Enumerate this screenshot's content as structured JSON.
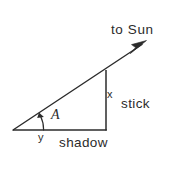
{
  "figure": {
    "kind": "geometry-diagram",
    "topic": "stick-shadow-sun-angle right triangle",
    "background_color": "#ffffff",
    "stroke_color": "#2b2b2b",
    "text_color": "#2b2b2b",
    "labels": {
      "sun_ray": "to Sun",
      "vertical_leg_symbol": "x",
      "vertical_leg_name": "stick",
      "horizontal_leg_symbol": "y",
      "horizontal_leg_name": "shadow",
      "angle_symbol": "A"
    },
    "icons": {
      "sun_ray_arrow": "arrow-up-right-icon",
      "angle_arc_arrow": "angle-arc-arrow-icon"
    },
    "geometry": {
      "vertex_angle": [
        13,
        130
      ],
      "vertex_right_angle": [
        106,
        130
      ],
      "vertex_stick_top": [
        106,
        70
      ],
      "arrow_tip": [
        145,
        42
      ],
      "horizontal_baseline_y": 130,
      "vertical_leg_x": 106,
      "angle_arc_radius": 30
    }
  }
}
